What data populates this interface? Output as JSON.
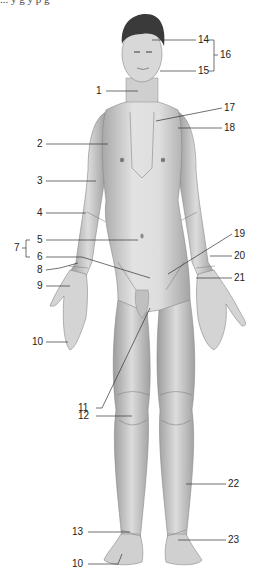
{
  "caption_fragment": "... y g y p g",
  "colors": {
    "background": "#ffffff",
    "skin_light": "#e4e4e4",
    "skin_mid": "#c8c8c8",
    "skin_dark": "#9a9a9a",
    "hair": "#3a3a3a",
    "leader_line": "#333333",
    "label_text": "#222222"
  },
  "labels": [
    {
      "id": "1",
      "text": "1"
    },
    {
      "id": "2",
      "text": "2"
    },
    {
      "id": "3",
      "text": "3"
    },
    {
      "id": "4",
      "text": "4"
    },
    {
      "id": "5",
      "text": "5"
    },
    {
      "id": "6",
      "text": "6"
    },
    {
      "id": "7",
      "text": "7"
    },
    {
      "id": "8",
      "text": "8"
    },
    {
      "id": "9",
      "text": "9"
    },
    {
      "id": "10a",
      "text": "10"
    },
    {
      "id": "11",
      "text": "11"
    },
    {
      "id": "12",
      "text": "12"
    },
    {
      "id": "13",
      "text": "13"
    },
    {
      "id": "10b",
      "text": "10"
    },
    {
      "id": "14",
      "text": "14"
    },
    {
      "id": "15",
      "text": "15"
    },
    {
      "id": "16",
      "text": "16"
    },
    {
      "id": "17",
      "text": "17"
    },
    {
      "id": "18",
      "text": "18"
    },
    {
      "id": "19",
      "text": "19"
    },
    {
      "id": "20",
      "text": "20"
    },
    {
      "id": "21",
      "text": "21"
    },
    {
      "id": "22",
      "text": "22"
    },
    {
      "id": "23",
      "text": "23"
    }
  ]
}
